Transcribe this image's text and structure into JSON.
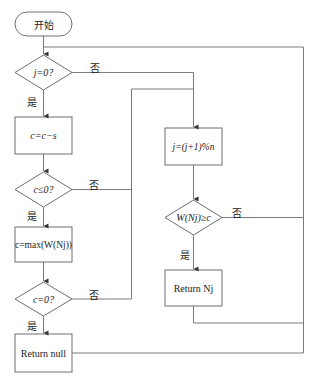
{
  "diagram": {
    "type": "flowchart",
    "nodes": {
      "start": {
        "label": "开始",
        "shape": "terminal"
      },
      "check_j": {
        "label": "j=0?",
        "shape": "decision"
      },
      "update_c": {
        "label": "c=c−s",
        "shape": "process"
      },
      "check_c_le": {
        "label": "c≤0?",
        "shape": "decision"
      },
      "set_c_max": {
        "label": "c=max(W(Nj))",
        "shape": "process"
      },
      "check_c_eq": {
        "label": "c=0?",
        "shape": "decision"
      },
      "return_null": {
        "label": "Return null",
        "shape": "process"
      },
      "update_j": {
        "label": "j=(j+1)%n",
        "shape": "process"
      },
      "check_w": {
        "label": "W(Nj)≥c",
        "shape": "decision"
      },
      "return_nj": {
        "label": "Return Nj",
        "shape": "process"
      }
    },
    "edge_labels": {
      "yes": "是",
      "no": "否"
    },
    "edges": [
      {
        "from": "start",
        "to": "check_j"
      },
      {
        "from": "check_j",
        "to": "update_c",
        "label": "是"
      },
      {
        "from": "check_j",
        "to": "update_j",
        "label": "否"
      },
      {
        "from": "update_c",
        "to": "check_c_le"
      },
      {
        "from": "check_c_le",
        "to": "set_c_max",
        "label": "是"
      },
      {
        "from": "check_c_le",
        "to": "update_j",
        "label": "否"
      },
      {
        "from": "set_c_max",
        "to": "check_c_eq"
      },
      {
        "from": "check_c_eq",
        "to": "return_null",
        "label": "是"
      },
      {
        "from": "check_c_eq",
        "to": "update_j",
        "label": "否"
      },
      {
        "from": "update_j",
        "to": "check_w"
      },
      {
        "from": "check_w",
        "to": "return_nj",
        "label": "是"
      },
      {
        "from": "check_w",
        "to": "check_j",
        "label": "否"
      },
      {
        "from": "return_nj",
        "to": "check_j"
      },
      {
        "from": "return_null",
        "to": "check_j"
      }
    ]
  }
}
